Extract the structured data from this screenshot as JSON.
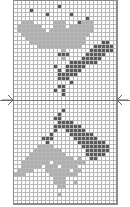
{
  "chart": {
    "type": "knitting-colorwork-chart",
    "columns": 26,
    "rows": 51,
    "legend": {
      "background": "#ffffff",
      "light": "#b0b0b0",
      "dark": "#595959",
      "gridline": "#b8b8b8"
    },
    "center_marker_row": 25,
    "markers": {
      "left": "arrow-right-icon",
      "right": "arrow-left-icon"
    },
    "pattern": [
      "..........................",
      "...........d..............",
      "....d.....................",
      "........d.....d...........",
      "..................d.......",
      "..lll.....lll...dlll......",
      ".llllll...lll.llllll......",
      ".lllllll.lllllllllll......",
      "..lllllllllllllllll.......",
      "...lllllllllllllll........",
      "....llllllllllllll....dd..",
      "......lllllllllll...ddddd.",
      "............l......dddddd.",
      "...........ddd....ddddd...",
      "............l....ddddd....",
      "..............ddddddd.....",
      "..........d..ddddd........",
      "...........d.dddd.........",
      "...........ddddd..........",
      "...........ddd............",
      "..............d...........",
      "...........dd.............",
      "..........d.d.............",
      "............d.............",
      "..........................",
      "..........................",
      "..........................",
      "............d.............",
      "...........d..............",
      "..........dd..............",
      "...........dddd...........",
      "..........ddddddd.........",
      "..........d..ddddd........",
      ".........d....dddddd......",
      ".......ddd.....dddddd.....",
      "........d.......ddddddd...",
      "......llll.......ddddddd..",
      ".....lllllll......dddddd..",
      "....lllllllll.....ddddd...",
      "...llllllllllll.l..dd.....",
      "..lllllll.llllllll........",
      "..lllll.lll.llll..........",
      ".llll...llllll.ll.........",
      "lll......lllllll..........",
      "..........lll.............",
      "..........lll..l..........",
      "...........ll.............",
      "..........................",
      "...........l..............",
      "..........................",
      ".........................."
    ]
  }
}
